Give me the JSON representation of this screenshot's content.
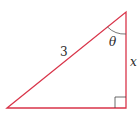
{
  "diagram": {
    "type": "right-triangle",
    "colors": {
      "sides": "#d9354a",
      "arc": "#555555",
      "text": "#2a2a2a"
    },
    "labels": {
      "hypotenuse": "3",
      "angle": "θ",
      "vertical_side": "x"
    },
    "vertices": {
      "bottom_left": [
        7,
        108
      ],
      "top_right": [
        126,
        12
      ],
      "bottom_right": [
        126,
        108
      ]
    },
    "right_angle_marker": "bottom-right"
  }
}
